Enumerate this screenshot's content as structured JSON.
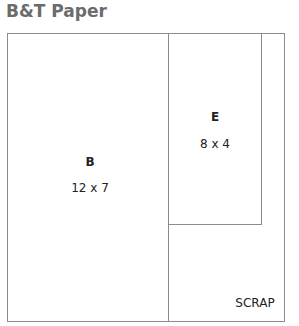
{
  "title": "B&T Paper",
  "pieces": [
    {
      "name": "B",
      "dims": "12 x 7"
    },
    {
      "name": "E",
      "dims": "8 x 4"
    }
  ],
  "scrap_label": "SCRAP"
}
